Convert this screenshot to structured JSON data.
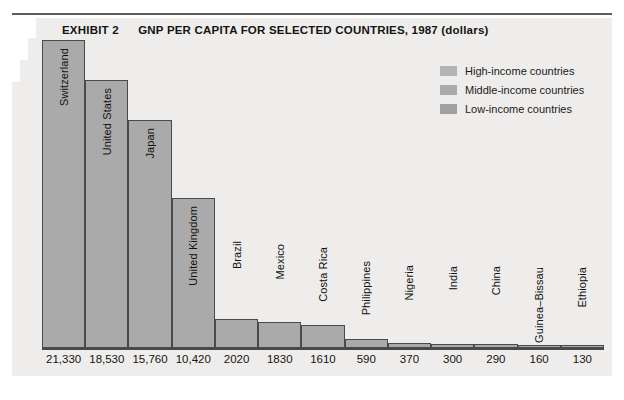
{
  "title": {
    "exhibit": "EXHIBIT 2",
    "heading": "GNP PER CAPITA FOR SELECTED COUNTRIES, 1987 (dollars)"
  },
  "legend": {
    "position": "top-right",
    "items": [
      {
        "label": "High-income countries",
        "color": "#b4b4b4"
      },
      {
        "label": "Middle-income countries",
        "color": "#aaaaaa"
      },
      {
        "label": "Low-income countries",
        "color": "#a0a0a0"
      }
    ]
  },
  "colors": {
    "panel_background": "#eeedeb",
    "bar_fill": "#aaaaaa",
    "bar_outline": "#4a4a4a",
    "rule": "#5d5d5d",
    "text": "#141414"
  },
  "chart_data": {
    "type": "bar",
    "title": "GNP PER CAPITA FOR SELECTED COUNTRIES, 1987 (dollars)",
    "xlabel": "",
    "ylabel": "",
    "ylim": [
      0,
      21330
    ],
    "grid": false,
    "legend_position": "top-right",
    "categories": [
      "Switzerland",
      "United States",
      "Japan",
      "United Kingdom",
      "Brazil",
      "Mexico",
      "Costa Rica",
      "Philippines",
      "Nigeria",
      "India",
      "China",
      "Guinea–Bissau",
      "Ethiopia"
    ],
    "values": [
      21330,
      18530,
      15760,
      10420,
      2020,
      1830,
      1610,
      590,
      370,
      300,
      290,
      160,
      130
    ],
    "value_labels": [
      "21,330",
      "18,530",
      "15,760",
      "10,420",
      "2020",
      "1830",
      "1610",
      "590",
      "370",
      "300",
      "290",
      "160",
      "130"
    ],
    "groups": [
      "high",
      "high",
      "high",
      "high",
      "middle",
      "middle",
      "middle",
      "middle",
      "low",
      "low",
      "low",
      "low",
      "low"
    ],
    "series": [
      {
        "name": "GNP per capita 1987 (dollars)",
        "values": [
          21330,
          18530,
          15760,
          10420,
          2020,
          1830,
          1610,
          590,
          370,
          300,
          290,
          160,
          130
        ]
      }
    ]
  }
}
